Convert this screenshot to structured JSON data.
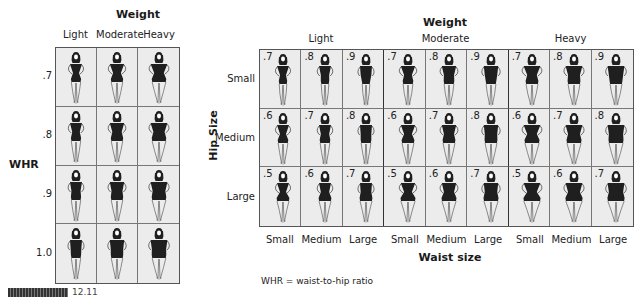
{
  "left_panel": {
    "title": "Weight",
    "column_headers": [
      "Light",
      "Moderate",
      "Heavy"
    ],
    "row_axis_label": "WHR",
    "row_headers": [
      ".7",
      ".8",
      ".9",
      "1.0"
    ]
  },
  "right_panel": {
    "title": "Weight",
    "weight_groups": [
      "Light",
      "Moderate",
      "Heavy"
    ],
    "row_axis_label": "Hip Size",
    "row_headers": [
      "Small",
      "Medium",
      "Large"
    ],
    "column_headers": [
      "Small",
      "Medium",
      "Large",
      "Small",
      "Medium",
      "Large",
      "Small",
      "Medium",
      "Large"
    ],
    "column_axis_label": "Waist size",
    "cell_values": [
      [
        ".7",
        ".8",
        ".9",
        ".7",
        ".8",
        ".9",
        ".7",
        ".8",
        ".9"
      ],
      [
        ".6",
        ".7",
        ".8",
        ".6",
        ".7",
        ".8",
        ".6",
        ".7",
        ".8"
      ],
      [
        ".5",
        ".6",
        ".7",
        ".5",
        ".6",
        ".7",
        ".5",
        ".6",
        ".7"
      ]
    ]
  },
  "footnote": "WHR = waist-to-hip ratio",
  "caption": {
    "label": "FIGURE 12.11"
  },
  "colors": {
    "cell_background": "#ececec",
    "figure_fill": "#1f1f1f",
    "grid_line": "#555555"
  }
}
